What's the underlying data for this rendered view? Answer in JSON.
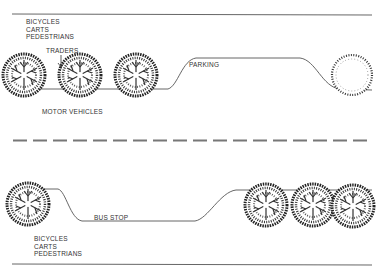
{
  "diagram": {
    "type": "street cross-section plan",
    "colors": {
      "line": "#555555",
      "text": "#333333",
      "tree": "#222222",
      "background": "#ffffff"
    },
    "upper_side": {
      "lane_labels": [
        "BICYCLES",
        "CARTS",
        "PEDESTRIANS"
      ],
      "traders_label": "TRADERS",
      "parking_label": "PARKING",
      "trees": 4
    },
    "carriageway": {
      "label": "MOTOR VEHICLES",
      "centerline": "dashed"
    },
    "lower_side": {
      "bus_stop_label": "BUS STOP",
      "lane_labels": [
        "BICYCLES",
        "CARTS",
        "PEDESTRIANS"
      ],
      "trees": 4
    }
  }
}
